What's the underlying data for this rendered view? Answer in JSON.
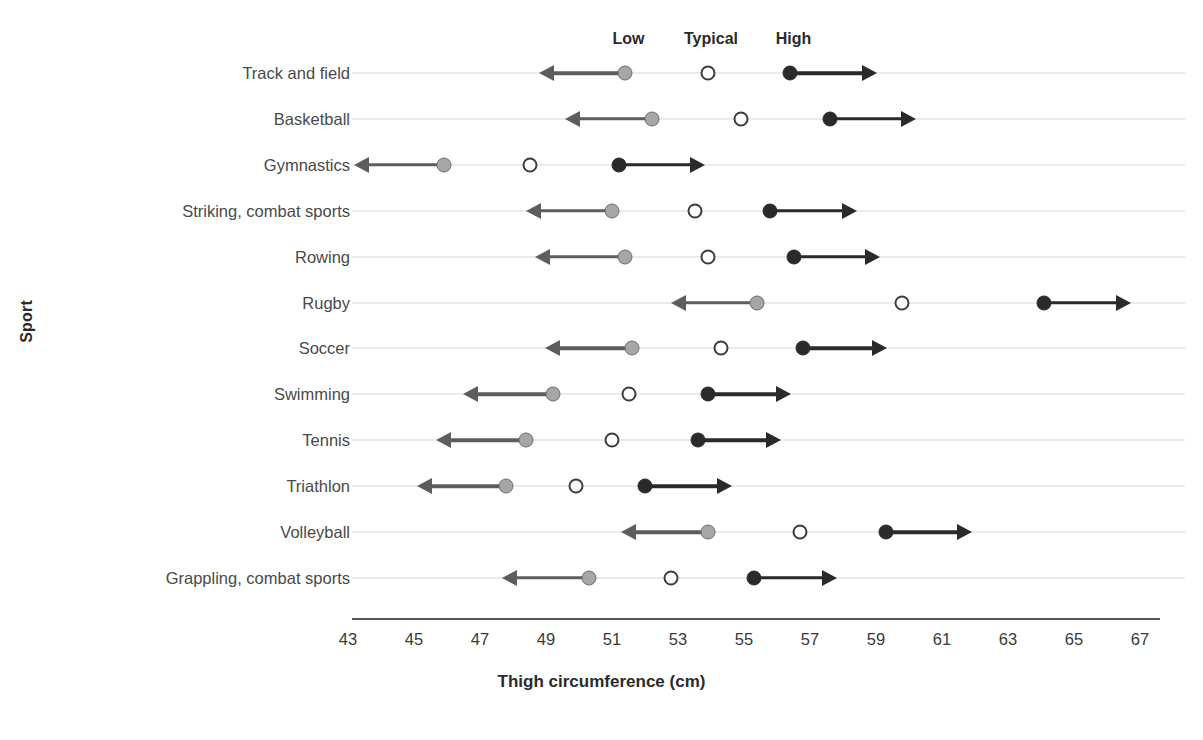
{
  "chart_data": {
    "type": "scatter",
    "title": "",
    "xlabel": "Thigh circumference (cm)",
    "ylabel": "Sport",
    "xlim": [
      43,
      67
    ],
    "xticks": [
      43,
      45,
      47,
      49,
      51,
      53,
      55,
      57,
      59,
      61,
      63,
      65,
      67
    ],
    "grid": "horizontal-row-lines",
    "legend_position": "top",
    "group_headers": [
      {
        "label": "Low",
        "x": 51.5
      },
      {
        "label": "Typical",
        "x": 54.0
      },
      {
        "label": "High",
        "x": 56.5
      }
    ],
    "series": [
      {
        "name": "Low",
        "marker": "gray-circle-with-left-arrow",
        "color": "#a6a6a6"
      },
      {
        "name": "Typical",
        "marker": "open-circle",
        "color": "#ffffff"
      },
      {
        "name": "High",
        "marker": "black-circle-with-right-arrow",
        "color": "#2a2a2a"
      }
    ],
    "categories": [
      "Track and field",
      "Basketball",
      "Gymnastics",
      "Striking, combat sports",
      "Rowing",
      "Rugby",
      "Soccer",
      "Swimming",
      "Tennis",
      "Triathlon",
      "Volleyball",
      "Grappling, combat sports"
    ],
    "rows": [
      {
        "sport": "Track and field",
        "low": 51.4,
        "typical": 53.9,
        "high": 56.4,
        "low_arrow_end": 48.9,
        "high_arrow_end": 58.9
      },
      {
        "sport": "Basketball",
        "low": 52.2,
        "typical": 54.9,
        "high": 57.6,
        "low_arrow_end": 49.7,
        "high_arrow_end": 60.1
      },
      {
        "sport": "Gymnastics",
        "low": 45.9,
        "typical": 48.5,
        "high": 51.2,
        "low_arrow_end": 43.3,
        "high_arrow_end": 53.7
      },
      {
        "sport": "Striking, combat sports",
        "low": 51.0,
        "typical": 53.5,
        "high": 55.8,
        "low_arrow_end": 48.5,
        "high_arrow_end": 58.3
      },
      {
        "sport": "Rowing",
        "low": 51.4,
        "typical": 53.9,
        "high": 56.5,
        "low_arrow_end": 48.8,
        "high_arrow_end": 59.0
      },
      {
        "sport": "Rugby",
        "low": 55.4,
        "typical": 59.8,
        "high": 64.1,
        "low_arrow_end": 52.9,
        "high_arrow_end": 66.6
      },
      {
        "sport": "Soccer",
        "low": 51.6,
        "typical": 54.3,
        "high": 56.8,
        "low_arrow_end": 49.1,
        "high_arrow_end": 59.2
      },
      {
        "sport": "Swimming",
        "low": 49.2,
        "typical": 51.5,
        "high": 53.9,
        "low_arrow_end": 46.6,
        "high_arrow_end": 56.3
      },
      {
        "sport": "Tennis",
        "low": 48.4,
        "typical": 51.0,
        "high": 53.6,
        "low_arrow_end": 45.8,
        "high_arrow_end": 56.0
      },
      {
        "sport": "Triathlon",
        "low": 47.8,
        "typical": 49.9,
        "high": 52.0,
        "low_arrow_end": 45.2,
        "high_arrow_end": 54.5
      },
      {
        "sport": "Volleyball",
        "low": 53.9,
        "typical": 56.7,
        "high": 59.3,
        "low_arrow_end": 51.4,
        "high_arrow_end": 61.8
      },
      {
        "sport": "Grappling, combat sports",
        "low": 50.3,
        "typical": 52.8,
        "high": 55.3,
        "low_arrow_end": 47.8,
        "high_arrow_end": 57.7
      }
    ]
  },
  "axis": {
    "x_title": "Thigh circumference (cm)",
    "y_title": "Sport",
    "x_ticks": [
      "43",
      "45",
      "47",
      "49",
      "51",
      "53",
      "55",
      "57",
      "59",
      "61",
      "63",
      "65",
      "67"
    ]
  },
  "colors": {
    "low": "#a6a6a6",
    "low_stroke": "#5d5d5d",
    "typical": "#ffffff",
    "typical_stroke": "#3d3d3d",
    "high": "#2a2a2a",
    "row_line": "#d8d8d8",
    "axis": "#555555",
    "text": "#3a3a3a"
  }
}
